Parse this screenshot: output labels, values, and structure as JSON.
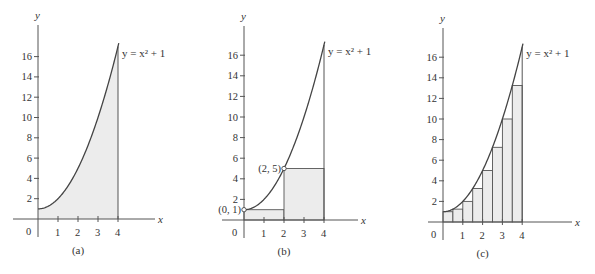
{
  "figure": {
    "equation_label": "y = x² + 1",
    "panels": [
      {
        "id": "a",
        "caption": "(a)"
      },
      {
        "id": "b",
        "caption": "(b)",
        "points": [
          {
            "label": "(0, 1)",
            "x": 0,
            "y": 1
          },
          {
            "label": "(2, 5)",
            "x": 2,
            "y": 5
          }
        ]
      },
      {
        "id": "c",
        "caption": "(c)"
      }
    ],
    "x_axis_label": "x",
    "y_axis_label": "y",
    "origin_label": "0",
    "x_ticks": [
      "1",
      "2",
      "3",
      "4"
    ],
    "y_ticks": [
      "2",
      "4",
      "6",
      "8",
      "10",
      "12",
      "14",
      "16"
    ]
  },
  "chart_data": [
    {
      "type": "area",
      "title": "(a)",
      "function": "y = x^2 + 1",
      "x": [
        0,
        0.5,
        1,
        1.5,
        2,
        2.5,
        3,
        3.5,
        4
      ],
      "values": [
        1,
        1.25,
        2,
        3.25,
        5,
        7.25,
        10,
        13.25,
        17
      ],
      "shaded_region": {
        "x_from": 0,
        "x_to": 4
      },
      "xlabel": "x",
      "ylabel": "y",
      "xlim": [
        0,
        4
      ],
      "ylim": [
        0,
        17
      ],
      "x_ticks": [
        1,
        2,
        3,
        4
      ],
      "y_ticks": [
        2,
        4,
        6,
        8,
        10,
        12,
        14,
        16
      ],
      "grid": false
    },
    {
      "type": "bar",
      "title": "(b)",
      "function": "y = x^2 + 1",
      "rectangles": [
        {
          "x_from": 0,
          "x_to": 2,
          "height": 1
        },
        {
          "x_from": 2,
          "x_to": 4,
          "height": 5
        }
      ],
      "annotations": [
        "(0, 1)",
        "(2, 5)"
      ],
      "xlabel": "x",
      "ylabel": "y",
      "xlim": [
        0,
        4
      ],
      "ylim": [
        0,
        17
      ],
      "x_ticks": [
        1,
        2,
        3,
        4
      ],
      "y_ticks": [
        2,
        4,
        6,
        8,
        10,
        12,
        14,
        16
      ],
      "grid": false
    },
    {
      "type": "bar",
      "title": "(c)",
      "function": "y = x^2 + 1",
      "rectangles": [
        {
          "x_from": 0,
          "x_to": 0.5,
          "height": 1
        },
        {
          "x_from": 0.5,
          "x_to": 1,
          "height": 1.25
        },
        {
          "x_from": 1,
          "x_to": 1.5,
          "height": 2
        },
        {
          "x_from": 1.5,
          "x_to": 2,
          "height": 3.25
        },
        {
          "x_from": 2,
          "x_to": 2.5,
          "height": 5
        },
        {
          "x_from": 2.5,
          "x_to": 3,
          "height": 7.25
        },
        {
          "x_from": 3,
          "x_to": 3.5,
          "height": 10
        },
        {
          "x_from": 3.5,
          "x_to": 4,
          "height": 13.25
        }
      ],
      "xlabel": "x",
      "ylabel": "y",
      "xlim": [
        0,
        4
      ],
      "ylim": [
        0,
        17
      ],
      "x_ticks": [
        1,
        2,
        3,
        4
      ],
      "y_ticks": [
        2,
        4,
        6,
        8,
        10,
        12,
        14,
        16
      ],
      "grid": false
    }
  ]
}
